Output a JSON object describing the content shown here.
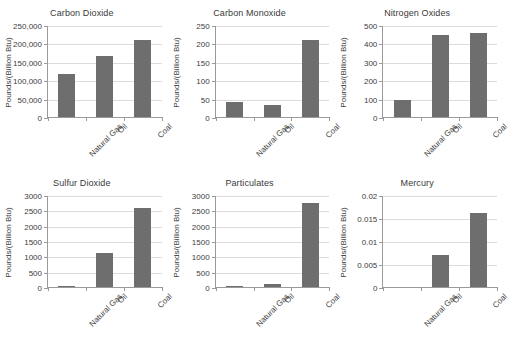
{
  "figure": {
    "categories": [
      "Natural Gas",
      "Oil",
      "Coal"
    ],
    "ylabel": "Pounds/(Billion Btu)",
    "bar_color": "#6e6e6e",
    "grid": true,
    "legend": "none"
  },
  "chart_data": [
    {
      "type": "bar",
      "title": "Carbon Dioxide",
      "categories": [
        "Natural Gas",
        "Oil",
        "Coal"
      ],
      "values": [
        118000,
        165000,
        209000
      ],
      "xlabel": "",
      "ylabel": "Pounds/(Billion Btu)",
      "ylim": [
        0,
        250000
      ],
      "yticks": [
        0,
        50000,
        100000,
        150000,
        200000,
        250000
      ],
      "ytick_labels": [
        "0",
        "50,000",
        "100,000",
        "150,000",
        "200,000",
        "250,000"
      ],
      "grid": true
    },
    {
      "type": "bar",
      "title": "Carbon Monoxide",
      "categories": [
        "Natural Gas",
        "Oil",
        "Coal"
      ],
      "values": [
        40,
        33,
        208
      ],
      "xlabel": "",
      "ylabel": "Pounds/(Billion Btu)",
      "ylim": [
        0,
        250
      ],
      "yticks": [
        0,
        50,
        100,
        150,
        200,
        250
      ],
      "ytick_labels": [
        "0",
        "50",
        "100",
        "150",
        "200",
        "250"
      ],
      "grid": true
    },
    {
      "type": "bar",
      "title": "Nitrogen Oxides",
      "categories": [
        "Natural Gas",
        "Oil",
        "Coal"
      ],
      "values": [
        92,
        448,
        457
      ],
      "xlabel": "",
      "ylabel": "Pounds/(Billion Btu)",
      "ylim": [
        0,
        500
      ],
      "yticks": [
        0,
        100,
        200,
        300,
        400,
        500
      ],
      "ytick_labels": [
        "0",
        "100",
        "200",
        "300",
        "400",
        "500"
      ],
      "grid": true
    },
    {
      "type": "bar",
      "title": "Sulfur Dioxide",
      "categories": [
        "Natural Gas",
        "Oil",
        "Coal"
      ],
      "values": [
        1,
        1122,
        2591
      ],
      "xlabel": "",
      "ylabel": "Pounds/(Billion Btu)",
      "ylim": [
        0,
        3000
      ],
      "yticks": [
        0,
        500,
        1000,
        1500,
        2000,
        2500,
        3000
      ],
      "ytick_labels": [
        "0",
        "500",
        "1000",
        "1500",
        "2000",
        "2500",
        "3000"
      ],
      "grid": true
    },
    {
      "type": "bar",
      "title": "Particulates",
      "categories": [
        "Natural Gas",
        "Oil",
        "Coal"
      ],
      "values": [
        7,
        84,
        2744
      ],
      "xlabel": "",
      "ylabel": "Pounds/(Billion Btu)",
      "ylim": [
        0,
        3000
      ],
      "yticks": [
        0,
        500,
        1000,
        1500,
        2000,
        2500,
        3000
      ],
      "ytick_labels": [
        "0",
        "500",
        "1000",
        "1500",
        "2000",
        "2500",
        "3000"
      ],
      "grid": true
    },
    {
      "type": "bar",
      "title": "Mercury",
      "categories": [
        "Natural Gas",
        "Oil",
        "Coal"
      ],
      "values": [
        0,
        0.007,
        0.016
      ],
      "xlabel": "",
      "ylabel": "Pounds/(Billion Btu)",
      "ylim": [
        0,
        0.02
      ],
      "yticks": [
        0,
        0.005,
        0.01,
        0.015,
        0.02
      ],
      "ytick_labels": [
        "0",
        "0.005",
        "0.01",
        "0.015",
        "0.02"
      ],
      "grid": true
    }
  ]
}
